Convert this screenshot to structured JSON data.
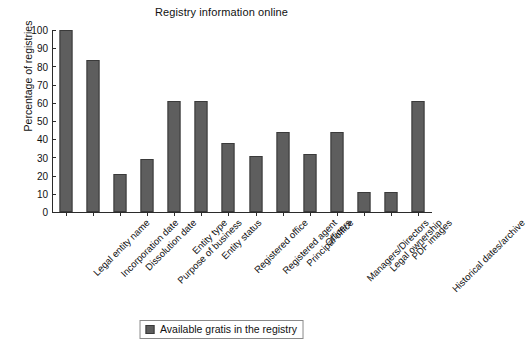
{
  "chart_data": {
    "type": "bar",
    "title": "Registry information online",
    "xlabel": "",
    "ylabel": "Percentage of registries",
    "ylim": [
      0,
      100
    ],
    "ytick_step": 10,
    "yticks": [
      0,
      10,
      20,
      30,
      40,
      50,
      60,
      70,
      80,
      90,
      100
    ],
    "grid": false,
    "legend_position": "bottom-center",
    "series_color": "#5e5e5e",
    "categories": [
      "Legal entity name",
      "Incorporation date",
      "Dissolution date",
      "Purpose of business",
      "Entity type",
      "Entity status",
      "Registered office",
      "Registered agent",
      "Principal office",
      "Officers",
      "Managers/Directors",
      "Legal ownership",
      "PDF images",
      "Historical dates/archive"
    ],
    "series": [
      {
        "name": "Available gratis in the registry",
        "values": [
          100,
          83.5,
          21,
          29,
          61,
          61,
          38,
          31,
          44,
          32,
          44,
          11,
          11,
          61
        ]
      }
    ]
  },
  "legend": {
    "items": [
      {
        "label": "Available gratis in the registry",
        "color": "#5e5e5e"
      }
    ]
  }
}
